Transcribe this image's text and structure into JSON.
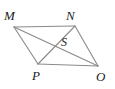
{
  "figure": {
    "kind": "parallelogram-with-diagonals",
    "stroke_color": "#8a8a8a",
    "background_color": "#ffffff",
    "label_color": "#1b1b1b",
    "vertices": [
      {
        "id": "M",
        "label": "M",
        "x": 14,
        "y": 27
      },
      {
        "id": "N",
        "label": "N",
        "x": 75,
        "y": 26
      },
      {
        "id": "O",
        "label": "O",
        "x": 98,
        "y": 66
      },
      {
        "id": "P",
        "label": "P",
        "x": 38,
        "y": 64
      }
    ],
    "intersection": {
      "id": "S",
      "label": "S",
      "x": 56,
      "y": 46
    },
    "edges": [
      {
        "name": "MN",
        "from": "M",
        "to": "N"
      },
      {
        "name": "NO",
        "from": "N",
        "to": "O"
      },
      {
        "name": "OP",
        "from": "O",
        "to": "P"
      },
      {
        "name": "PM",
        "from": "P",
        "to": "M"
      }
    ],
    "diagonals": [
      {
        "name": "MO",
        "from": "M",
        "to": "O"
      },
      {
        "name": "NP",
        "from": "N",
        "to": "P"
      }
    ]
  }
}
